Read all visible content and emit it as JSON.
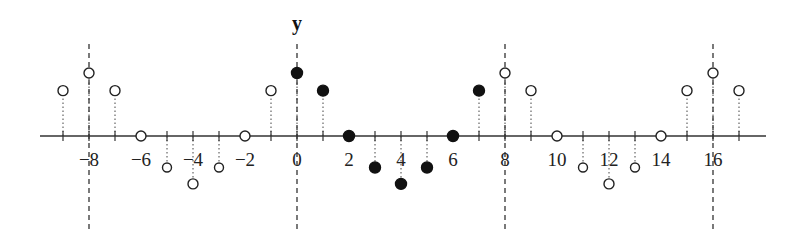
{
  "diagram": {
    "axis_label_y": "y",
    "axis_label_y_at": 0,
    "pixel": {
      "origin_x": 297,
      "axis_y": 136,
      "unit_x": 26,
      "unit_y": 63,
      "x_min_px": 40,
      "x_max_px": 766
    },
    "period_markers": [
      -8,
      0,
      8,
      16
    ],
    "tick_labels": [
      {
        "n": -8,
        "text": "−8"
      },
      {
        "n": -6,
        "text": "−6"
      },
      {
        "n": -4,
        "text": "−4"
      },
      {
        "n": -2,
        "text": "−2"
      },
      {
        "n": 0,
        "text": "0"
      },
      {
        "n": 2,
        "text": "2"
      },
      {
        "n": 4,
        "text": "4"
      },
      {
        "n": 6,
        "text": "6"
      },
      {
        "n": 8,
        "text": "8"
      },
      {
        "n": 10,
        "text": "10"
      },
      {
        "n": 12,
        "text": "12"
      },
      {
        "n": 14,
        "text": "14"
      },
      {
        "n": 16,
        "text": "16"
      }
    ],
    "one_period_values": [
      1,
      0.72,
      0,
      -0.5,
      -0.76,
      -0.5,
      0,
      0.72
    ],
    "filled_range": [
      0,
      7
    ],
    "n_range": [
      -9,
      17
    ],
    "colors": {
      "axis": "#333333",
      "stem": "#444444",
      "filled": "#111111",
      "hollow_stroke": "#222222",
      "hollow_fill": "#ffffff"
    }
  },
  "chart_data": {
    "type": "stem",
    "title": "",
    "xlabel": "",
    "ylabel": "y",
    "x": [
      -9,
      -8,
      -7,
      -6,
      -5,
      -4,
      -3,
      -2,
      -1,
      0,
      1,
      2,
      3,
      4,
      5,
      6,
      7,
      8,
      9,
      10,
      11,
      12,
      13,
      14,
      15,
      16,
      17
    ],
    "series": [
      {
        "name": "one period (filled)",
        "x": [
          0,
          1,
          2,
          3,
          4,
          5,
          6,
          7
        ],
        "values": [
          1,
          0.72,
          0,
          -0.5,
          -0.76,
          -0.5,
          0,
          0.72
        ]
      },
      {
        "name": "periodic extension (hollow)",
        "x": [
          -9,
          -8,
          -7,
          -6,
          -5,
          -4,
          -3,
          -2,
          -1,
          8,
          9,
          10,
          11,
          12,
          13,
          14,
          15,
          16,
          17
        ],
        "values": [
          0.72,
          1,
          0.72,
          0,
          -0.5,
          -0.76,
          -0.5,
          0,
          0.72,
          1,
          0.72,
          0,
          -0.5,
          -0.76,
          -0.5,
          0,
          0.72,
          1,
          0.72
        ]
      }
    ],
    "period": 8,
    "dashed_lines_at": [
      -8,
      0,
      8,
      16
    ],
    "xticks_labeled": [
      -8,
      -6,
      -4,
      -2,
      0,
      2,
      4,
      6,
      8,
      10,
      12,
      14,
      16
    ],
    "grid": false
  }
}
